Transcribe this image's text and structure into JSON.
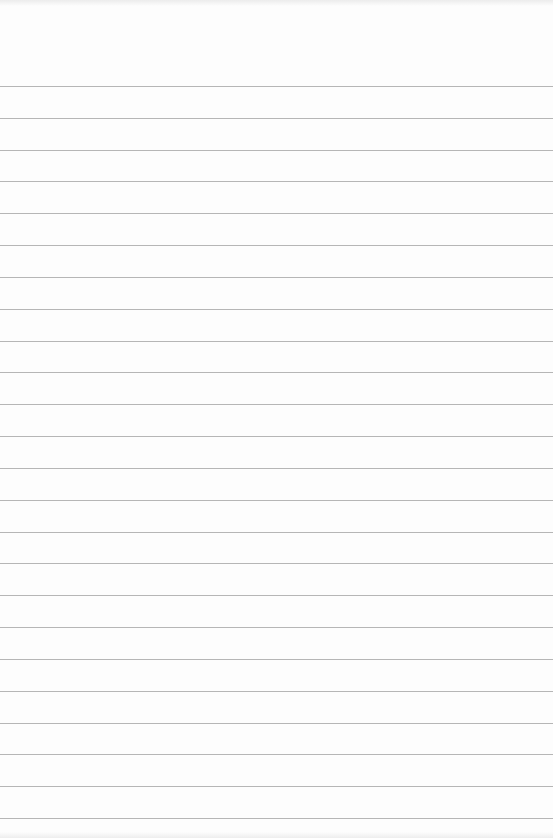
{
  "paper": {
    "type": "lined-paper",
    "background_color": "#fdfdfd",
    "rule_color": "#a9a9a9",
    "first_rule_y": 86,
    "rule_spacing": 31.83,
    "rule_count": 24
  }
}
